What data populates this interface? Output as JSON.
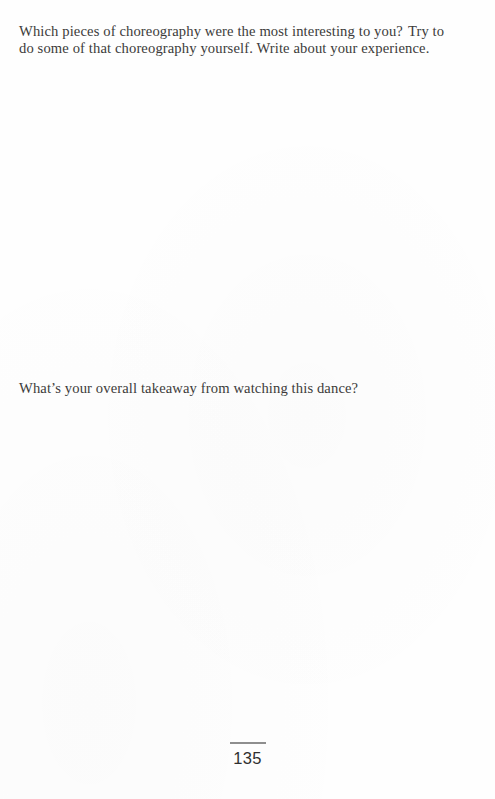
{
  "page": {
    "number": "135",
    "background_color": "#fefefe",
    "ink_color": "#3c3b3a",
    "rule_color": "#8e8e8e"
  },
  "content": {
    "prompts": [
      {
        "id": "choreography",
        "text_before_gap": "Which pieces of choreography were the most interesting to you?",
        "text_after_gap": "Try to do some of that choreography yourself. Write about your experience."
      },
      {
        "id": "takeaway",
        "text": "What’s your overall takeaway from watching this dance?"
      }
    ],
    "answer_spaces": [
      {
        "id": "choreography-answer",
        "label": "blank writing space"
      },
      {
        "id": "takeaway-answer",
        "label": "blank writing space"
      }
    ]
  }
}
